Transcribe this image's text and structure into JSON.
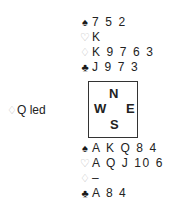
{
  "north": {
    "spades": {
      "symbol": "♠",
      "cards": "7 5 2"
    },
    "hearts": {
      "symbol": "♡",
      "cards": "K"
    },
    "diamonds": {
      "symbol": "♢",
      "cards": "K 9 7 6 3"
    },
    "clubs": {
      "symbol": "♣",
      "cards": "J 9 7 3"
    }
  },
  "compass": {
    "n": "N",
    "w": "W",
    "e": "E",
    "s": "S"
  },
  "south": {
    "spades": {
      "symbol": "♠",
      "cards": "A K Q 8 4"
    },
    "hearts": {
      "symbol": "♡",
      "cards": "A Q J 10 6"
    },
    "diamonds": {
      "symbol": "♢",
      "cards": "–"
    },
    "clubs": {
      "symbol": "♣",
      "cards": "A 8 4"
    }
  },
  "opening_lead": {
    "symbol": "♢",
    "text": "Q led"
  }
}
